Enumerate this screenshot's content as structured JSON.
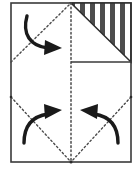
{
  "diagram": {
    "type": "origami-fold-diagram",
    "canvas": {
      "width": 139,
      "height": 182
    },
    "colors": {
      "paper_fill": "#ffffff",
      "outline": "#3a3a3a",
      "fold_line": "#4a4a4a",
      "stripe_dark": "#4d4d4d",
      "stripe_light": "#ffffff",
      "arrow": "#1a1a1a",
      "background": "#ffffff"
    },
    "sheet": {
      "name": "paper-sheet",
      "left": 11,
      "top": 3,
      "right": 131,
      "bottom": 162,
      "outline_width": 1.6
    },
    "folded_corner": {
      "name": "folded-corner-top-right",
      "shape": "triangle",
      "points": "71,3 131,3 131,62",
      "hypotenuse": "71,3 to 131,62",
      "fill_pattern": "vertical-stripes",
      "stripe_count": 12,
      "stripe_width": 5,
      "stripe_dark": "#4d4d4d",
      "stripe_light": "#ffffff"
    },
    "fold_lines": [
      {
        "name": "fold-line-vertical-center",
        "from": "71,3",
        "to": "71,162",
        "style": "dotted"
      },
      {
        "name": "fold-line-diagonal-top-left",
        "from": "11,62",
        "to": "71,3",
        "style": "dotted"
      },
      {
        "name": "fold-line-diagonal-bottom-left",
        "from": "11,97",
        "to": "71,162",
        "style": "dotted"
      },
      {
        "name": "fold-line-diagonal-bottom-right",
        "from": "131,97",
        "to": "71,162",
        "style": "dotted"
      },
      {
        "name": "fold-line-horizontal-corner-base",
        "from": "71,62",
        "to": "131,62",
        "style": "solid"
      }
    ],
    "arrows": [
      {
        "name": "arrow-top-left",
        "direction": "curve-down-right",
        "meaning": "fold top-left corner toward center",
        "path": "M 27,16 C 22,34 30,46 48,48",
        "head_at": "60,48",
        "head_angle": 10
      },
      {
        "name": "arrow-bottom-left",
        "direction": "curve-up-right",
        "meaning": "fold bottom-left corner upward to center",
        "path": "M 24,143 C 24,124 34,116 48,114",
        "head_at": "60,112",
        "head_angle": -16
      },
      {
        "name": "arrow-bottom-right",
        "direction": "curve-up-left",
        "meaning": "fold bottom-right corner upward to center",
        "path": "M 118,143 C 118,124 108,116 94,114",
        "head_at": "82,112",
        "head_angle": 196
      }
    ]
  }
}
